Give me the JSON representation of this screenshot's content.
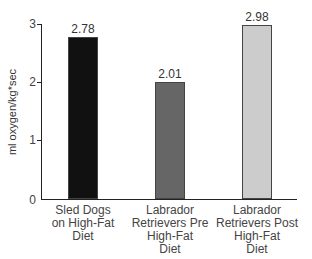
{
  "chart_data": {
    "type": "bar",
    "title": "",
    "xlabel": "",
    "ylabel": "ml oxygen/kg*sec",
    "ylim": [
      0,
      3
    ],
    "yticks": [
      "0",
      "1",
      "2",
      "3"
    ],
    "grid": false,
    "categories": [
      "Sled Dogs on High-Fat Diet",
      "Labrador Retrievers Pre High-Fat Diet",
      "Labrador Retrievers Post High-Fat Diet"
    ],
    "category_lines": [
      [
        "Sled Dogs",
        "on High-Fat",
        "Diet"
      ],
      [
        "Labrador",
        "Retrievers Pre",
        "High-Fat",
        "Diet"
      ],
      [
        "Labrador",
        "Retrievers Post",
        "High-Fat",
        "Diet"
      ]
    ],
    "values": [
      2.78,
      2.01,
      2.98
    ],
    "value_labels": [
      "2.78",
      "2.01",
      "2.98"
    ],
    "colors": [
      "#111111",
      "#666666",
      "#cccccc"
    ]
  }
}
